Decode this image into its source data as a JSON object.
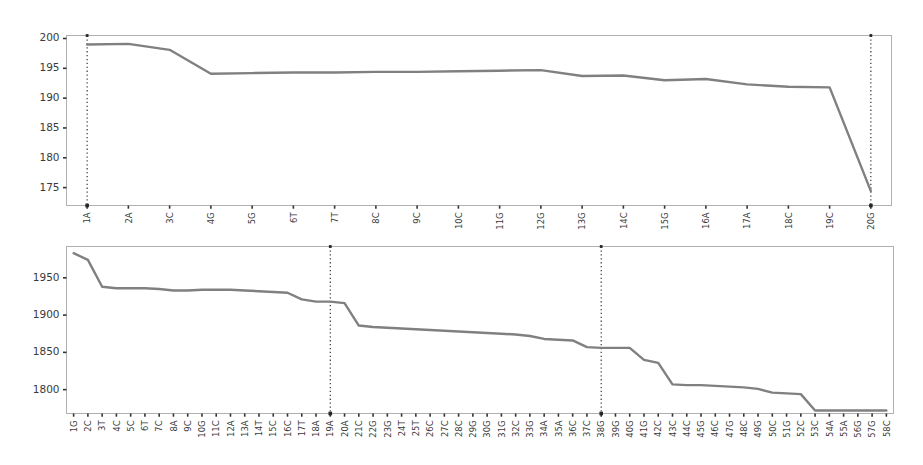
{
  "figure": {
    "background_color": "#ffffff",
    "line_color": "#808080",
    "frame_color": "#b0b0b0",
    "marker_line_color": "#262626",
    "tick_label_color": "#3a3a3a"
  },
  "chart_data": [
    {
      "id": "top-chart",
      "type": "line",
      "title": "",
      "subtitle": "",
      "xlabel": "",
      "ylabel": "",
      "grid": false,
      "legend": null,
      "legend_position": "none",
      "ylim": [
        172.0,
        200.5
      ],
      "ytick_labels": [
        "175",
        "180",
        "185",
        "190",
        "195",
        "200"
      ],
      "yticks": [
        175,
        180,
        185,
        190,
        195,
        200
      ],
      "categories": [
        "1A",
        "2A",
        "3C",
        "4G",
        "5G",
        "6T",
        "7T",
        "8C",
        "9C",
        "10C",
        "11G",
        "12G",
        "13G",
        "14C",
        "15G",
        "16A",
        "17A",
        "18C",
        "19C",
        "20G"
      ],
      "values": [
        199.0,
        199.1,
        198.1,
        194.1,
        194.2,
        194.3,
        194.3,
        194.4,
        194.4,
        194.5,
        194.6,
        194.7,
        193.7,
        193.8,
        193.0,
        193.2,
        192.3,
        191.9,
        191.8,
        174.4
      ],
      "vertical_markers": [
        "1A",
        "20G"
      ],
      "annotations": []
    },
    {
      "id": "bottom-chart",
      "type": "line",
      "title": "",
      "subtitle": "",
      "xlabel": "",
      "ylabel": "",
      "grid": false,
      "legend": null,
      "legend_position": "none",
      "ylim": [
        1768.0,
        1992.0
      ],
      "ytick_labels": [
        "1800",
        "1850",
        "1900",
        "1950"
      ],
      "yticks": [
        1800,
        1850,
        1900,
        1950
      ],
      "categories": [
        "1G",
        "2C",
        "3T",
        "4C",
        "5C",
        "6T",
        "7C",
        "8A",
        "9C",
        "10G",
        "11C",
        "12A",
        "13A",
        "14T",
        "15C",
        "16C",
        "17T",
        "18A",
        "19A",
        "20A",
        "21C",
        "22G",
        "23G",
        "24T",
        "25T",
        "26C",
        "27C",
        "28C",
        "29G",
        "30G",
        "31G",
        "32C",
        "33G",
        "34A",
        "35A",
        "36C",
        "37C",
        "38G",
        "39G",
        "40G",
        "41G",
        "42C",
        "43C",
        "44C",
        "45G",
        "46C",
        "47G",
        "48C",
        "49G",
        "50C",
        "51G",
        "52C",
        "53C",
        "54A",
        "55A",
        "56G",
        "57G",
        "58C"
      ],
      "values": [
        1983,
        1974,
        1938,
        1936,
        1936,
        1936,
        1935,
        1933,
        1933,
        1934,
        1934,
        1934,
        1933,
        1932,
        1931,
        1930,
        1921,
        1918,
        1918,
        1916,
        1886,
        1884,
        1883,
        1882,
        1881,
        1880,
        1879,
        1878,
        1877,
        1876,
        1875,
        1874,
        1872,
        1868,
        1867,
        1866,
        1857,
        1856,
        1856,
        1856,
        1840,
        1836,
        1807,
        1806,
        1806,
        1805,
        1804,
        1803,
        1801,
        1796,
        1795,
        1794,
        1772,
        1772,
        1772,
        1772,
        1772,
        1772
      ],
      "vertical_markers": [
        "19A",
        "38G"
      ],
      "annotations": []
    }
  ]
}
